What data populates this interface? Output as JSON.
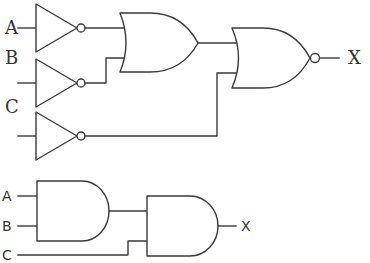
{
  "circuits": [
    {
      "name": "NOT-OR-NOR circuit",
      "inputs": [
        "A",
        "B",
        "C"
      ],
      "output": "X",
      "gates": [
        {
          "type": "NOT",
          "input": "A"
        },
        {
          "type": "NOT",
          "input": "B"
        },
        {
          "type": "NOT",
          "input": "C"
        },
        {
          "type": "OR",
          "inputs": [
            "NOT A",
            "NOT B"
          ]
        },
        {
          "type": "NOR",
          "inputs": [
            "OR output",
            "NOT C"
          ]
        }
      ]
    },
    {
      "name": "AND-AND circuit",
      "inputs": [
        "A",
        "B",
        "C"
      ],
      "output": "X",
      "gates": [
        {
          "type": "AND",
          "inputs": [
            "A",
            "B"
          ]
        },
        {
          "type": "AND",
          "inputs": [
            "AND output",
            "C"
          ]
        }
      ]
    }
  ],
  "labels": {
    "top": {
      "a": "A",
      "b": "B",
      "c": "C",
      "x": "X"
    },
    "bottom": {
      "a": "A",
      "b": "B",
      "c": "C",
      "x": "X"
    }
  }
}
